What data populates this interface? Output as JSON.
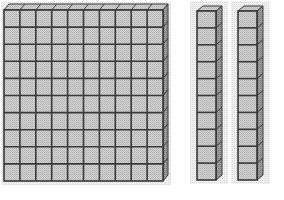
{
  "diagram": {
    "blocks": [
      {
        "type": "hundred-flat",
        "rows": 10,
        "cols": 10,
        "value": 100
      },
      {
        "type": "ten-rod",
        "rows": 10,
        "cols": 1,
        "value": 10
      },
      {
        "type": "ten-rod",
        "rows": 10,
        "cols": 1,
        "value": 10
      }
    ],
    "colors": {
      "face": "#c8c8c8",
      "grid_line": "#3a3a3a",
      "depth_side": "#8a8a8a",
      "shadow": "#e2e2e2",
      "background": "#ffffff"
    }
  }
}
